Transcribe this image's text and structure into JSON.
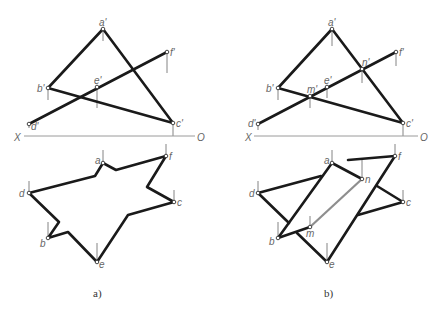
{
  "figure": {
    "panels": [
      {
        "caption": "a)",
        "axis": {
          "left_label": "X",
          "right_label": "O"
        },
        "front_view_labels": {
          "a": "a'",
          "b": "b'",
          "c": "c'",
          "d": "d'",
          "e": "e'",
          "f": "f'"
        },
        "top_view_labels": {
          "a": "a",
          "b": "b",
          "c": "c",
          "d": "d",
          "e": "e",
          "f": "f"
        }
      },
      {
        "caption": "b)",
        "axis": {
          "left_label": "X",
          "right_label": "O"
        },
        "front_view_labels": {
          "a": "a'",
          "b": "b'",
          "c": "c'",
          "d": "d'",
          "e": "e'",
          "f": "f'",
          "m": "m'",
          "n": "n'"
        },
        "top_view_labels": {
          "a": "a",
          "b": "b",
          "c": "c",
          "d": "d",
          "e": "e",
          "f": "f",
          "m": "m",
          "n": "n"
        }
      }
    ],
    "colors": {
      "line": "#1a1a1a",
      "intersection_line": "#8e8e8e",
      "axis": "#9a9a9a",
      "label": "#666666"
    }
  }
}
